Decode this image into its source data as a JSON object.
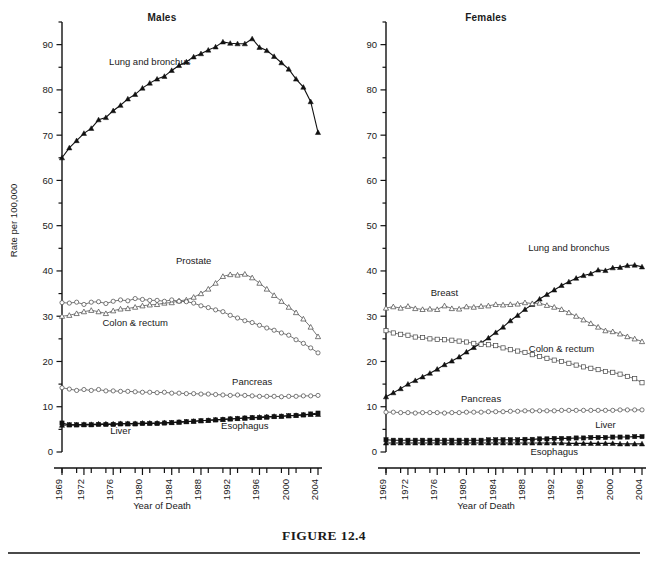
{
  "figure": {
    "caption": "FIGURE 12.4"
  },
  "panels": [
    {
      "id": "males",
      "title": "Males",
      "ylabel": "Rate per 100,000",
      "xlabel": "Year of Death",
      "show_ylabel": true
    },
    {
      "id": "females",
      "title": "Females",
      "ylabel": "Rate per 100,000",
      "xlabel": "Year of Death",
      "show_ylabel": false
    }
  ],
  "axes": {
    "y_tick_labels": [
      "0",
      "10",
      "20",
      "30",
      "40",
      "50",
      "60",
      "70",
      "80",
      "90"
    ],
    "y_ticks_major": [
      0,
      10,
      20,
      30,
      40,
      50,
      60,
      70,
      80,
      90
    ],
    "y_ticks_minor": [
      5,
      15,
      25,
      35,
      45,
      55,
      65,
      75,
      85,
      95
    ],
    "y_min": 0,
    "y_max": 95,
    "x_tick_labels": [
      "1969",
      "1972",
      "1976",
      "1980",
      "1984",
      "1988",
      "1992",
      "1996",
      "2000",
      "2004"
    ],
    "x_label_years": [
      1969,
      1972,
      1976,
      1980,
      1984,
      1988,
      1992,
      1996,
      2000,
      2004
    ],
    "x_tick_years": [
      1969,
      1971,
      1973,
      1975,
      1977,
      1979,
      1981,
      1983,
      1985,
      1987,
      1989,
      1991,
      1993,
      1995,
      1997,
      1999,
      2001,
      2003
    ],
    "x_min": 1969,
    "x_max": 2004,
    "grid": false,
    "legend": "inline-annotations"
  },
  "chart_data": {
    "type": "line",
    "xlabel": "Year of Death",
    "ylabel": "Rate per 100,000",
    "xlim": [
      1969,
      2004
    ],
    "ylim": [
      0,
      95
    ],
    "grid": false,
    "legend_position": "inline-annotations",
    "x": [
      1969,
      1970,
      1971,
      1972,
      1973,
      1974,
      1975,
      1976,
      1977,
      1978,
      1979,
      1980,
      1981,
      1982,
      1983,
      1984,
      1985,
      1986,
      1987,
      1988,
      1989,
      1990,
      1991,
      1992,
      1993,
      1994,
      1995,
      1996,
      1997,
      1998,
      1999,
      2000,
      2001,
      2002,
      2003,
      2004
    ],
    "panels": [
      {
        "name": "Males",
        "series": [
          {
            "name": "Lung and bronchus",
            "marker": "filled-triangle",
            "style": "solid",
            "label_x": 1981,
            "label_y": 85.5,
            "values": [
              65.0,
              67.2,
              68.8,
              70.4,
              71.5,
              73.4,
              73.9,
              75.4,
              76.6,
              78.0,
              79.0,
              80.4,
              81.5,
              82.4,
              83.0,
              84.3,
              85.4,
              86.2,
              87.3,
              88.0,
              88.8,
              89.5,
              90.6,
              90.3,
              90.2,
              90.2,
              91.3,
              89.4,
              88.7,
              87.4,
              86.0,
              84.6,
              82.4,
              80.6,
              77.4,
              70.6
            ]
          },
          {
            "name": "Prostate",
            "marker": "open-triangle",
            "style": "open",
            "label_x": 1987,
            "label_y": 41.5,
            "values": [
              30.0,
              30.2,
              30.6,
              31.0,
              31.3,
              31.0,
              30.6,
              31.2,
              31.6,
              31.7,
              32.0,
              32.3,
              32.5,
              32.6,
              32.9,
              33.0,
              33.4,
              33.6,
              34.2,
              35.0,
              36.0,
              37.3,
              38.8,
              39.2,
              39.1,
              39.3,
              38.5,
              37.3,
              36.0,
              34.6,
              33.3,
              32.0,
              30.8,
              29.4,
              27.6,
              25.5
            ]
          },
          {
            "name": "Colon & rectum",
            "marker": "open-circle",
            "style": "open",
            "label_x": 1979,
            "label_y": 27.8,
            "values": [
              33.0,
              32.9,
              33.1,
              32.6,
              33.1,
              33.2,
              32.8,
              33.3,
              33.6,
              33.4,
              33.9,
              33.7,
              33.5,
              33.5,
              33.3,
              33.6,
              33.3,
              33.2,
              32.9,
              32.3,
              31.9,
              31.4,
              31.0,
              30.2,
              29.6,
              29.0,
              28.6,
              28.0,
              27.4,
              26.9,
              26.3,
              25.8,
              24.8,
              24.0,
              23.0,
              21.9
            ]
          },
          {
            "name": "Pancreas",
            "marker": "open-circle",
            "style": "open",
            "label_x": 1995,
            "label_y": 14.7,
            "values": [
              14.2,
              13.9,
              13.6,
              13.8,
              13.6,
              13.8,
              13.5,
              13.5,
              13.4,
              13.4,
              13.3,
              13.2,
              13.2,
              13.1,
              13.2,
              13.0,
              13.0,
              12.9,
              12.9,
              12.8,
              12.8,
              12.7,
              12.6,
              12.5,
              12.6,
              12.5,
              12.4,
              12.3,
              12.3,
              12.3,
              12.2,
              12.3,
              12.3,
              12.4,
              12.4,
              12.5
            ]
          },
          {
            "name": "Liver",
            "marker": "filled-square",
            "style": "solid",
            "label_x": 1977,
            "label_y": 4.0,
            "values": [
              6.4,
              6.0,
              6.0,
              6.0,
              6.0,
              6.1,
              6.1,
              6.1,
              6.2,
              6.2,
              6.2,
              6.3,
              6.3,
              6.3,
              6.4,
              6.5,
              6.6,
              6.7,
              6.8,
              6.9,
              7.0,
              7.1,
              7.2,
              7.3,
              7.4,
              7.5,
              7.6,
              7.6,
              7.7,
              7.8,
              7.9,
              8.0,
              8.1,
              8.2,
              8.4,
              8.6
            ]
          },
          {
            "name": "Esophagus",
            "marker": "filled-triangle",
            "style": "solid",
            "label_x": 1994,
            "label_y": 5.0,
            "values": [
              5.9,
              6.0,
              6.0,
              6.1,
              6.1,
              6.2,
              6.2,
              6.2,
              6.3,
              6.3,
              6.3,
              6.4,
              6.4,
              6.4,
              6.5,
              6.5,
              6.6,
              6.7,
              6.8,
              6.9,
              7.0,
              7.1,
              7.2,
              7.3,
              7.4,
              7.5,
              7.6,
              7.7,
              7.8,
              7.9,
              7.9,
              8.0,
              8.1,
              8.2,
              8.3,
              8.3
            ]
          }
        ]
      },
      {
        "name": "Females",
        "series": [
          {
            "name": "Lung and bronchus",
            "marker": "filled-triangle",
            "style": "solid",
            "label_x": 1994,
            "label_y": 44.5,
            "values": [
              12.2,
              13.1,
              14.0,
              15.0,
              15.8,
              16.6,
              17.4,
              18.3,
              19.3,
              20.1,
              21.0,
              22.1,
              23.1,
              24.1,
              25.2,
              26.4,
              27.6,
              29.0,
              30.2,
              31.5,
              32.6,
              33.8,
              34.8,
              35.8,
              36.8,
              37.6,
              38.4,
              39.0,
              39.4,
              40.2,
              40.1,
              40.7,
              40.8,
              41.2,
              41.3,
              40.9
            ]
          },
          {
            "name": "Breast",
            "marker": "open-triangle",
            "style": "open",
            "label_x": 1977,
            "label_y": 34.5,
            "values": [
              31.8,
              32.1,
              31.8,
              32.2,
              31.7,
              31.5,
              31.6,
              31.5,
              32.3,
              31.7,
              31.6,
              32.1,
              32.0,
              32.2,
              32.3,
              32.6,
              32.5,
              32.6,
              32.7,
              33.0,
              32.8,
              32.9,
              32.4,
              32.0,
              31.5,
              30.8,
              30.0,
              29.2,
              28.4,
              27.6,
              26.8,
              26.6,
              26.1,
              25.5,
              25.0,
              24.4
            ]
          },
          {
            "name": "Colon & rectum",
            "marker": "open-square",
            "style": "open",
            "label_x": 1993,
            "label_y": 22.0,
            "values": [
              26.8,
              26.3,
              26.0,
              25.8,
              25.4,
              25.3,
              25.0,
              24.9,
              24.8,
              24.7,
              24.5,
              24.3,
              24.0,
              23.8,
              23.7,
              23.5,
              23.0,
              22.6,
              22.3,
              22.0,
              21.5,
              21.1,
              20.7,
              20.3,
              20.0,
              19.6,
              19.2,
              18.8,
              18.5,
              18.2,
              17.8,
              17.6,
              17.2,
              16.7,
              16.2,
              15.3
            ]
          },
          {
            "name": "Pancreas",
            "marker": "open-circle",
            "style": "open",
            "label_x": 1982,
            "label_y": 11.0,
            "values": [
              8.8,
              8.8,
              8.7,
              8.7,
              8.6,
              8.7,
              8.7,
              8.7,
              8.6,
              8.7,
              8.7,
              8.8,
              8.8,
              8.8,
              8.9,
              8.9,
              8.9,
              9.0,
              9.0,
              9.1,
              9.1,
              9.1,
              9.1,
              9.1,
              9.2,
              9.2,
              9.2,
              9.2,
              9.2,
              9.2,
              9.2,
              9.2,
              9.3,
              9.3,
              9.3,
              9.3
            ]
          },
          {
            "name": "Liver",
            "marker": "filled-square",
            "style": "solid",
            "label_x": 1999,
            "label_y": 5.2,
            "values": [
              2.7,
              2.6,
              2.6,
              2.6,
              2.6,
              2.6,
              2.6,
              2.6,
              2.6,
              2.6,
              2.6,
              2.6,
              2.6,
              2.6,
              2.7,
              2.7,
              2.7,
              2.7,
              2.7,
              2.8,
              2.8,
              2.9,
              2.9,
              3.0,
              3.0,
              3.0,
              3.1,
              3.1,
              3.2,
              3.2,
              3.2,
              3.3,
              3.3,
              3.3,
              3.4,
              3.4
            ]
          },
          {
            "name": "Esophagus",
            "marker": "filled-triangle",
            "style": "solid",
            "label_x": 1992,
            "label_y": -0.6,
            "values": [
              2.0,
              2.0,
              2.0,
              2.0,
              2.0,
              2.0,
              2.0,
              2.0,
              2.0,
              2.0,
              2.0,
              2.0,
              2.0,
              2.0,
              2.0,
              2.0,
              2.0,
              2.0,
              2.0,
              2.0,
              2.0,
              2.0,
              2.0,
              2.0,
              2.0,
              1.9,
              1.9,
              1.9,
              1.9,
              1.9,
              1.9,
              1.9,
              1.8,
              1.8,
              1.8,
              1.8
            ]
          }
        ]
      }
    ]
  }
}
